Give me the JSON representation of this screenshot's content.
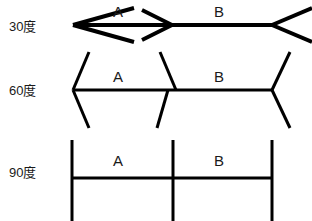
{
  "figure": {
    "background_color": "#ffffff",
    "stroke_color": "#000000",
    "width": 312,
    "height": 221
  },
  "rows": [
    {
      "id": "row-30",
      "label": "30度",
      "angle_degrees": 30,
      "segments": [
        {
          "name": "A",
          "label": "A"
        },
        {
          "name": "B",
          "label": "B"
        }
      ],
      "geometry": {
        "baseline_y": 25,
        "x_left": 72,
        "x_mid": 172,
        "x_right": 272,
        "fin_length": 44,
        "stroke_width": 4,
        "left_end_style": "arrowhead-outward",
        "mid_style": "arrowhead-inward-right",
        "right_end_style": "fins-outward"
      }
    },
    {
      "id": "row-60",
      "label": "60度",
      "angle_degrees": 60,
      "segments": [
        {
          "name": "A",
          "label": "A"
        },
        {
          "name": "B",
          "label": "B"
        }
      ],
      "geometry": {
        "baseline_y": 90,
        "x_left": 73,
        "x_mid": 172,
        "x_right": 272,
        "fin_length": 42,
        "stroke_width": 3,
        "left_end_style": "fins-outward",
        "mid_style": "fins-crossing",
        "right_end_style": "fins-outward"
      }
    },
    {
      "id": "row-90",
      "label": "90度",
      "angle_degrees": 90,
      "segments": [
        {
          "name": "A",
          "label": "A"
        },
        {
          "name": "B",
          "label": "B"
        }
      ],
      "geometry": {
        "baseline_y": 178,
        "x_left": 72,
        "x_mid": 173,
        "x_right": 272,
        "fin_length": 40,
        "stroke_width": 3,
        "left_end_style": "vertical-bar",
        "mid_style": "vertical-bar",
        "right_end_style": "vertical-bar"
      }
    }
  ]
}
